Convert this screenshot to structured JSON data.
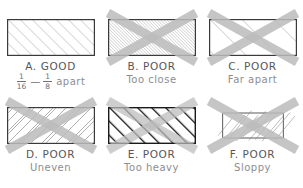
{
  "figure": {
    "background_color": "#ffffff",
    "border_color": "#3a3a3a",
    "x_overlay_color": "#b9b9b9",
    "caption_main_color": "#56565a",
    "caption_sub_color": "#8d8d92"
  },
  "panels": [
    {
      "id": "a",
      "label": "A.  GOOD",
      "sublabel": "apart",
      "spacing_min": "1",
      "spacing_min_den": "16",
      "spacing_dash": "—",
      "spacing_max": "1",
      "spacing_max_den": "8",
      "rejected": false,
      "hatch_style": "even-medium",
      "hatch_spacing_px": 6,
      "hatch_width_px": 0.8,
      "hatch_color": "#9b9b9b",
      "border_color": "#3a3a3a"
    },
    {
      "id": "b",
      "label": "B.  POOR",
      "sublabel": "Too close",
      "rejected": true,
      "hatch_style": "too-dense",
      "hatch_spacing_px": 1.6,
      "hatch_width_px": 0.75,
      "hatch_color": "#a5a5a5",
      "border_color": "#3a3a3a"
    },
    {
      "id": "c",
      "label": "C.  POOR",
      "sublabel": "Far apart",
      "rejected": true,
      "hatch_style": "too-sparse",
      "hatch_spacing_px": 16,
      "hatch_width_px": 0.8,
      "hatch_color": "#9b9b9b",
      "border_color": "#3a3a3a"
    },
    {
      "id": "d",
      "label": "D.  POOR",
      "sublabel": "Uneven",
      "rejected": true,
      "hatch_style": "uneven",
      "hatch_spacing_px": 6,
      "hatch_width_px": 0.8,
      "hatch_color": "#9b9b9b",
      "border_color": "#3a3a3a"
    },
    {
      "id": "e",
      "label": "E.  POOR",
      "sublabel": "Too heavy",
      "rejected": true,
      "hatch_style": "too-heavy",
      "hatch_spacing_px": 7,
      "hatch_width_px": 2.6,
      "hatch_color": "#111111",
      "border_color": "#1a1a1a"
    },
    {
      "id": "f",
      "label": "F.  POOR",
      "sublabel": "Sloppy",
      "rejected": true,
      "hatch_style": "sloppy-overshoot",
      "hatch_spacing_px": 9,
      "hatch_width_px": 0.8,
      "hatch_color": "#8f8f8f",
      "border_color": "#3a3a3a"
    }
  ]
}
